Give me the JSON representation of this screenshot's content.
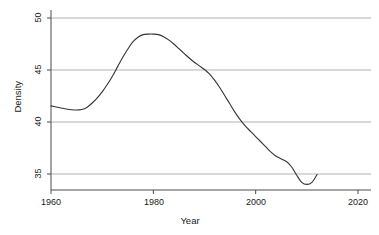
{
  "chart_data": {
    "type": "line",
    "title": "",
    "xlabel": "Year",
    "ylabel": "Density",
    "xlim": [
      1956,
      2022
    ],
    "ylim": [
      33.5,
      50.4
    ],
    "xticks": [
      1960,
      1980,
      2000,
      2020
    ],
    "yticks": [
      35,
      40,
      45,
      50
    ],
    "xtick_labels": [
      "1960",
      "1980",
      "2000",
      "2020"
    ],
    "ytick_labels": [
      "35",
      "40",
      "45",
      "50"
    ],
    "grid": "horizontal",
    "legend": "none",
    "line_color": "#333333",
    "grid_color": "#b3b3b3",
    "axis_color": "#4d4d4d",
    "series": [
      {
        "name": "Density",
        "x": [
          1960,
          1961,
          1962,
          1963,
          1964,
          1965,
          1966,
          1967,
          1968,
          1969,
          1970,
          1971,
          1972,
          1973,
          1974,
          1975,
          1976,
          1977,
          1978,
          1979,
          1980,
          1981,
          1982,
          1983,
          1984,
          1985,
          1986,
          1987,
          1988,
          1989,
          1990,
          1991,
          1992,
          1993,
          1994,
          1995,
          1996,
          1997,
          1998,
          1999,
          2000,
          2001,
          2002,
          2003,
          2004,
          2005,
          2006,
          2007,
          2008,
          2009,
          2010,
          2011,
          2012
        ],
        "values": [
          41.55,
          41.45,
          41.35,
          41.25,
          41.18,
          41.15,
          41.2,
          41.4,
          41.8,
          42.3,
          42.9,
          43.6,
          44.4,
          45.3,
          46.2,
          47.0,
          47.7,
          48.15,
          48.4,
          48.45,
          48.45,
          48.4,
          48.2,
          47.9,
          47.5,
          47.05,
          46.6,
          46.15,
          45.75,
          45.4,
          45.05,
          44.6,
          44.0,
          43.3,
          42.5,
          41.7,
          40.9,
          40.2,
          39.6,
          39.1,
          38.6,
          38.1,
          37.6,
          37.1,
          36.7,
          36.45,
          36.2,
          35.7,
          34.9,
          34.2,
          34.0,
          34.2,
          34.95
        ]
      }
    ]
  },
  "axes": {
    "y_title": "Density",
    "x_title": "Year"
  }
}
